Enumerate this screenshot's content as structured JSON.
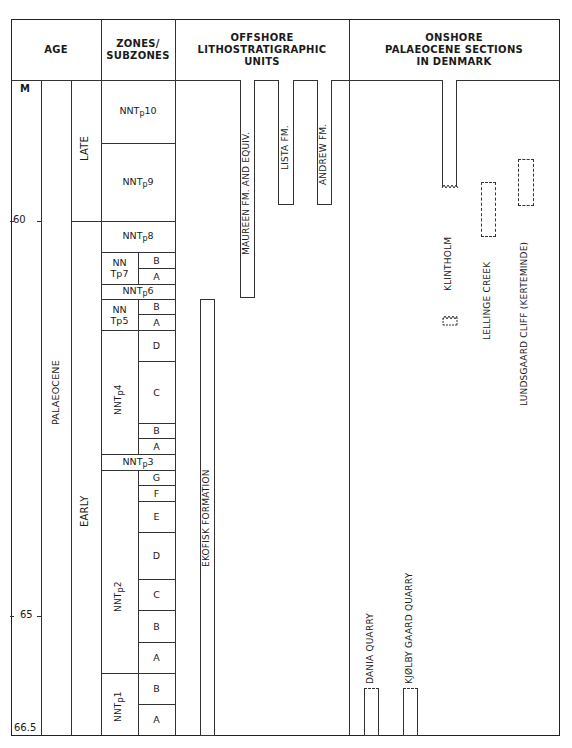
{
  "headers": {
    "age": "AGE",
    "zones": "ZONES/\nSUBZONES",
    "zones_line1": "ZONES/",
    "zones_line2": "SUBZONES",
    "offshore_line1": "OFFSHORE",
    "offshore_line2": "LITHOSTRATIGRAPHIC",
    "offshore_line3": "UNITS",
    "onshore_line1": "ONSHORE",
    "onshore_line2": "PALAEOCENE SECTIONS",
    "onshore_line3": "IN DENMARK"
  },
  "axis": {
    "unit": "M",
    "ticks": [
      {
        "label": "60",
        "value": 60
      },
      {
        "label": "65",
        "value": 65
      },
      {
        "label": "66.5",
        "value": 66.5
      }
    ]
  },
  "age": {
    "epoch": "PALAEOCENE",
    "subdivisions": [
      {
        "label": "LATE"
      },
      {
        "label": "EARLY"
      }
    ]
  },
  "zones": [
    {
      "name": "NNTp10",
      "base": "NNT",
      "sub": "p",
      "num": "10",
      "subzones": []
    },
    {
      "name": "NNTp9",
      "base": "NNT",
      "sub": "p",
      "num": "9",
      "subzones": []
    },
    {
      "name": "NNTp8",
      "base": "NNT",
      "sub": "p",
      "num": "8",
      "subzones": []
    },
    {
      "name": "NNTp7",
      "line1": "NN",
      "line2": "Tp7",
      "subzones": [
        "B",
        "A"
      ]
    },
    {
      "name": "NNTp6",
      "base": "NNT",
      "sub": "p",
      "num": "6",
      "subzones": []
    },
    {
      "name": "NNTp5",
      "line1": "NN",
      "line2": "Tp5",
      "subzones": [
        "B",
        "A"
      ]
    },
    {
      "name": "NNTp4",
      "base": "NNT",
      "sub": "p",
      "num": "4",
      "subzones": [
        "D",
        "C",
        "B",
        "A"
      ]
    },
    {
      "name": "NNTp3",
      "base": "NNT",
      "sub": "p",
      "num": "3",
      "subzones": []
    },
    {
      "name": "NNTp2",
      "base": "NNT",
      "sub": "p",
      "num": "2",
      "subzones": [
        "G",
        "F",
        "E",
        "D",
        "C",
        "B",
        "A"
      ]
    },
    {
      "name": "NNTp1",
      "base": "NNT",
      "sub": "p",
      "num": "1",
      "subzones": [
        "B",
        "A"
      ]
    }
  ],
  "offshore_units": [
    {
      "label": "EKOFISK FORMATION"
    },
    {
      "label": "MAUREEN FM. AND EQUIV."
    },
    {
      "label": "LISTA FM."
    },
    {
      "label": "ANDREW FM."
    }
  ],
  "onshore_sections": [
    {
      "label": "DANIA QUARRY"
    },
    {
      "label": "KJØLBY GAARD QUARRY"
    },
    {
      "label": "KLINTHOLM"
    },
    {
      "label": "LELLINGE CREEK"
    },
    {
      "label": "LUNDSGAARD CLIFF (KERTEMINDE)"
    }
  ]
}
